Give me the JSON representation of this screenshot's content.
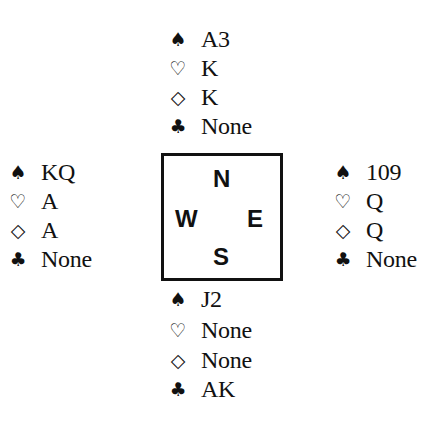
{
  "diagram": {
    "suit_symbols": {
      "spades": "♠",
      "hearts": "♡",
      "diamonds": "◇",
      "clubs": "♣"
    },
    "compass": {
      "north": "N",
      "west": "W",
      "east": "E",
      "south": "S"
    },
    "hands": {
      "north": {
        "spades": "A3",
        "hearts": "K",
        "diamonds": "K",
        "clubs": "None"
      },
      "west": {
        "spades": "KQ",
        "hearts": "A",
        "diamonds": "A",
        "clubs": "None"
      },
      "east": {
        "spades": "109",
        "hearts": "Q",
        "diamonds": "Q",
        "clubs": "None"
      },
      "south": {
        "spades": "J2",
        "hearts": "None",
        "diamonds": "None",
        "clubs": "AK"
      }
    }
  }
}
